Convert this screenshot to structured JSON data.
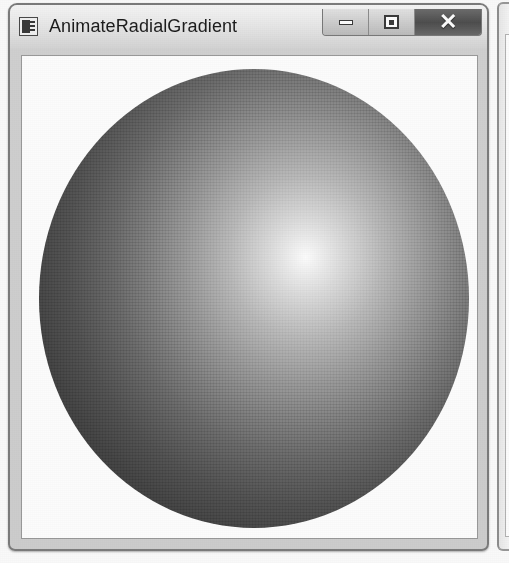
{
  "window": {
    "title": "AnimateRadialGradient",
    "icon": "application-window-icon",
    "controls": {
      "minimize": {
        "name": "minimize-button",
        "glyph": "minimize-icon",
        "label": ""
      },
      "maximize": {
        "name": "maximize-button",
        "glyph": "maximize-icon",
        "label": ""
      },
      "close": {
        "name": "close-button",
        "glyph": "close-icon",
        "label": "✕"
      }
    },
    "colors": {
      "frame_border": "#7d7d7d",
      "titlebar": "#d6d6d6",
      "client_background": "#ffffff",
      "close_button": "#4f4f4f"
    }
  },
  "client": {
    "shape": {
      "name": "radial-gradient-ellipse",
      "type": "radial-gradient",
      "center_color": "#ffffff",
      "edge_color": "#3c3c3c",
      "highlight_position": "62% 41%"
    }
  },
  "neighbor_window": {
    "name": "adjacent-window-sliver",
    "title": ""
  }
}
